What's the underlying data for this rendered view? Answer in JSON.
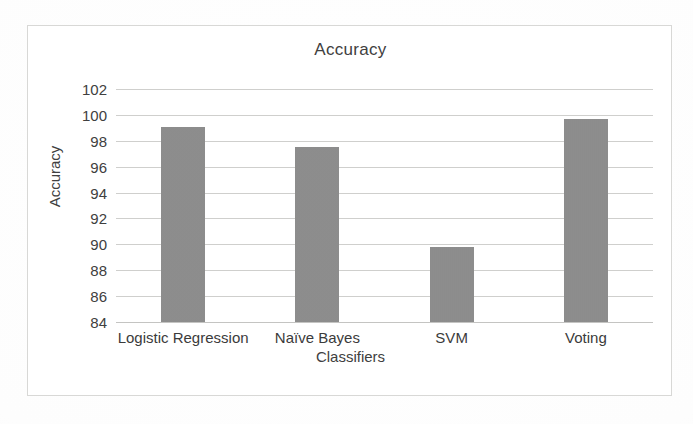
{
  "chart_data": {
    "type": "bar",
    "title": "Accuracy",
    "xlabel": "Classifiers",
    "ylabel": "Accuracy",
    "categories": [
      "Logistic Regression",
      "Naïve Bayes",
      "SVM",
      "Voting"
    ],
    "values": [
      99.1,
      97.55,
      89.8,
      99.7
    ],
    "ylim": [
      84,
      102
    ],
    "ytick_labels": [
      "84",
      "86",
      "88",
      "90",
      "92",
      "94",
      "96",
      "98",
      "100",
      "102"
    ],
    "ytick_values": [
      84,
      86,
      88,
      90,
      92,
      94,
      96,
      98,
      100,
      102
    ],
    "grid": true,
    "legend": false,
    "bar_color": "#8c8c8c",
    "gridline_color": "#cfcfcd",
    "frame_color": "#d8d8d6",
    "background_color": "#ffffff"
  }
}
